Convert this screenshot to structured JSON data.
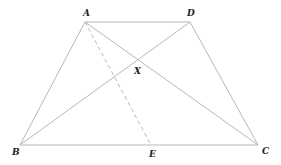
{
  "diagram": {
    "type": "trapezoid-with-diagonals",
    "points": {
      "A": {
        "label": "A",
        "x": 85,
        "y": 22,
        "lx": 84,
        "ly": 16
      },
      "D": {
        "label": "D",
        "x": 190,
        "y": 22,
        "lx": 189,
        "ly": 16
      },
      "B": {
        "label": "B",
        "x": 20,
        "y": 145,
        "lx": 12,
        "ly": 155
      },
      "C": {
        "label": "C",
        "x": 258,
        "y": 145,
        "lx": 262,
        "ly": 154
      },
      "E": {
        "label": "E",
        "x": 151,
        "y": 145,
        "lx": 150,
        "ly": 157
      },
      "X": {
        "label": "X",
        "x": 137,
        "y": 62,
        "lx": 135,
        "ly": 73
      }
    },
    "segments": [
      {
        "from": "A",
        "to": "D",
        "style": "solid"
      },
      {
        "from": "A",
        "to": "B",
        "style": "solid"
      },
      {
        "from": "D",
        "to": "C",
        "style": "solid"
      },
      {
        "from": "B",
        "to": "C",
        "style": "solid"
      },
      {
        "from": "A",
        "to": "C",
        "style": "solid"
      },
      {
        "from": "B",
        "to": "D",
        "style": "solid"
      },
      {
        "from": "A",
        "to": "E",
        "style": "dashed"
      }
    ],
    "colors": {
      "line": "#b8b8b8",
      "label": "#222222",
      "background": "#ffffff"
    }
  },
  "labels": {
    "A": "A",
    "B": "B",
    "C": "C",
    "D": "D",
    "E": "E",
    "X": "X"
  }
}
